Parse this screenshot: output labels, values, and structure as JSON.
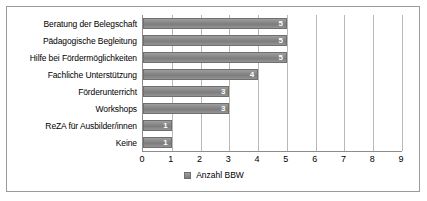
{
  "chart_data": {
    "type": "bar",
    "orientation": "horizontal",
    "title": "",
    "xlabel": "",
    "ylabel": "",
    "xlim": [
      0,
      9
    ],
    "xticks": [
      0,
      1,
      2,
      3,
      4,
      5,
      6,
      7,
      8,
      9
    ],
    "grid": true,
    "legend_position": "bottom",
    "categories": [
      "Beratung der Belegschaft",
      "Pädagogische Begleitung",
      "Hilfe bei Fördermöglichkeiten",
      "Fachliche Unterstützung",
      "Förderunterricht",
      "Workshops",
      "ReZA für Ausbilder/innen",
      "Keine"
    ],
    "series": [
      {
        "name": "Anzahl BBW",
        "values": [
          5,
          5,
          5,
          4,
          3,
          3,
          1,
          1
        ],
        "color": "#8a8a8a"
      }
    ],
    "data_labels": [
      "5",
      "5",
      "5",
      "4",
      "3",
      "3",
      "1",
      "1"
    ]
  },
  "legend": {
    "entries": [
      {
        "label": "Anzahl BBW",
        "swatch": "legend-swatch"
      }
    ]
  },
  "colors": {
    "bar": "#8a8a8a",
    "bar_border": "#6f6f6f",
    "gridline": "#b8b8b8",
    "axis": "#8c8c8c",
    "frame_border": "#9a9a9a",
    "background": "#ffffff",
    "data_label": "#ffffff",
    "text": "#000000"
  }
}
